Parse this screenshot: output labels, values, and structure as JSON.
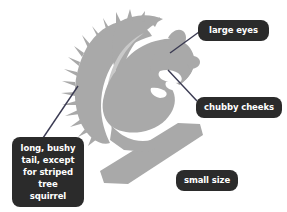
{
  "figure": {
    "background_color": "#ffffff",
    "silhouette_color": "#a9a9a9",
    "silhouette_light_color": "#c9c9c9",
    "badge_color": "#2b2b2b",
    "badge_text_color": "#ffffff",
    "leader_line_color": "#3a3a52"
  },
  "callouts": [
    {
      "id": "large-eyes",
      "label": "large eyes",
      "target": "head-eye"
    },
    {
      "id": "chubby-cheeks",
      "label": "chubby cheeks",
      "target": "cheek-paws"
    },
    {
      "id": "long-tail",
      "label": "long, bushy\ntail, except\nfor striped\ntree squirrel",
      "target": "tail"
    },
    {
      "id": "small-size",
      "label": "small size",
      "target": "none"
    }
  ]
}
